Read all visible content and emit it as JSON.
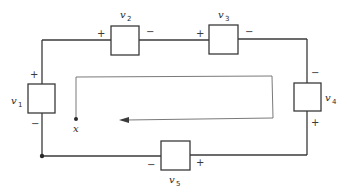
{
  "diagram": {
    "type": "circuit",
    "colors": {
      "wire": "#3a3a3a",
      "path": "#6a6a6a",
      "background": "#ffffff"
    },
    "elements": [
      {
        "id": "v1",
        "label_base": "v",
        "label_sub": "1",
        "side": "left",
        "top_sign": "+",
        "bottom_sign": "−"
      },
      {
        "id": "v2",
        "label_base": "v",
        "label_sub": "2",
        "side": "top",
        "left_sign": "+",
        "right_sign": "−"
      },
      {
        "id": "v3",
        "label_base": "v",
        "label_sub": "3",
        "side": "top",
        "left_sign": "+",
        "right_sign": "−"
      },
      {
        "id": "v4",
        "label_base": "v",
        "label_sub": "4",
        "side": "right",
        "top_sign": "−",
        "bottom_sign": "+"
      },
      {
        "id": "v5",
        "label_base": "v",
        "label_sub": "5",
        "side": "bottom",
        "left_sign": "−",
        "right_sign": "+"
      }
    ],
    "start_node": {
      "label": "x"
    },
    "traversal_direction": "clockwise"
  }
}
